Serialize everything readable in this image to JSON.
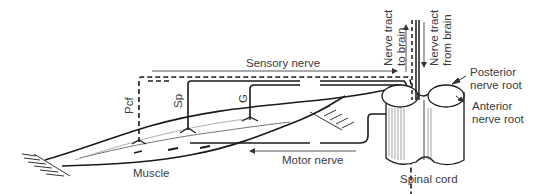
{
  "diagram": {
    "type": "anatomical reflex arc diagram",
    "labels": {
      "sensory_nerve": "Sensory nerve",
      "motor_nerve": "Motor nerve",
      "muscle": "Muscle",
      "spinal_cord": "Spinal cord",
      "posterior_root_line1": "Posterior",
      "posterior_root_line2": "nerve root",
      "anterior_root_line1": "Anterior",
      "anterior_root_line2": "nerve root",
      "tract_to_brain_line1": "Nerve tract",
      "tract_to_brain_line2": "to brain",
      "tract_from_brain_line1": "Nerve tract",
      "tract_from_brain_line2": "from brain",
      "receptor_pcf": "Pcf",
      "receptor_sp": "Sp",
      "receptor_g": "G"
    },
    "colors": {
      "line": "#1a1a1a",
      "text": "#3a3a3a",
      "background": "#ffffff"
    }
  }
}
